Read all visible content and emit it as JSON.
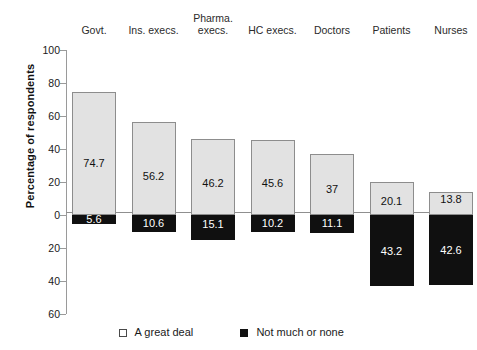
{
  "chart_data": {
    "type": "bar",
    "title": "",
    "subtitle": "",
    "xlabel": "",
    "ylabel": "Percentage of respondents",
    "categories": [
      "Govt.",
      "Ins. execs.",
      "Pharma. execs.",
      "HC execs.",
      "Doctors",
      "Patients",
      "Nurses"
    ],
    "category_lines": [
      [
        "Govt."
      ],
      [
        "Ins. execs."
      ],
      [
        "Pharma.",
        "execs."
      ],
      [
        "HC execs."
      ],
      [
        "Doctors"
      ],
      [
        "Patients"
      ],
      [
        "Nurses"
      ]
    ],
    "series": [
      {
        "name": "A great deal",
        "color": "#e2e2e2",
        "direction": "up",
        "values": [
          74.7,
          56.2,
          46.2,
          45.6,
          37,
          20.1,
          13.8
        ],
        "labels": [
          "74.7",
          "56.2",
          "46.2",
          "45.6",
          "37",
          "20.1",
          "13.8"
        ]
      },
      {
        "name": "Not much or none",
        "color": "#101010",
        "direction": "down",
        "values": [
          5.6,
          10.6,
          15.1,
          10.2,
          11.1,
          43.2,
          42.6
        ],
        "labels": [
          "5.6",
          "10.6",
          "15.1",
          "10.2",
          "11.1",
          "43.2",
          "42.6"
        ]
      }
    ],
    "yticks": [
      100,
      80,
      60,
      40,
      20,
      0,
      20,
      40,
      60
    ],
    "ytick_labels": [
      "100",
      "80",
      "60",
      "40",
      "20",
      "0",
      "20",
      "40",
      "60"
    ],
    "ytick_values": [
      100,
      80,
      60,
      40,
      20,
      0,
      -20,
      -40,
      -60
    ],
    "ylim": [
      -60,
      100
    ],
    "grid": false,
    "legend_position": "bottom"
  },
  "legend": {
    "items": [
      {
        "label": "A great deal",
        "swatch": "light-square-icon"
      },
      {
        "label": "Not much or none",
        "swatch": "dark-square-icon"
      }
    ]
  }
}
